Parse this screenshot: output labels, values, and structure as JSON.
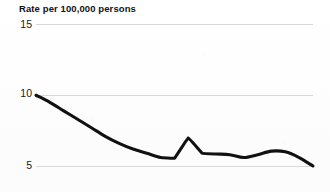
{
  "chart_data": {
    "type": "line",
    "title": "Rate per 100,000 persons",
    "xlabel": "",
    "ylabel": "Rate per 100,000 persons",
    "ylim": [
      5,
      15
    ],
    "yticks": [
      5,
      10,
      15
    ],
    "ytick_labels": [
      "5",
      "10",
      "15"
    ],
    "grid": true,
    "grid_axis": "y",
    "legend": false,
    "xaxis_visible": false,
    "series": [
      {
        "name": "rate",
        "color": "#111111",
        "x": [
          0,
          1,
          2,
          3,
          4,
          5,
          6,
          7,
          8,
          9,
          10,
          11,
          12,
          13,
          14,
          15,
          16,
          17,
          18,
          19,
          20
        ],
        "values": [
          10.0,
          9.5,
          8.9,
          8.3,
          7.7,
          7.1,
          6.6,
          6.2,
          5.9,
          5.6,
          5.55,
          7.0,
          5.9,
          5.85,
          5.8,
          5.6,
          5.8,
          6.05,
          6.0,
          5.6,
          5.0
        ]
      }
    ],
    "annotations": []
  },
  "axes": {
    "y_labels": {
      "top": "15",
      "middle": "10",
      "bottom": "5"
    }
  },
  "colors": {
    "line": "#111111",
    "gridline": "#d8d8d8",
    "background": "#fefefe",
    "text": "#1a1a1a"
  }
}
